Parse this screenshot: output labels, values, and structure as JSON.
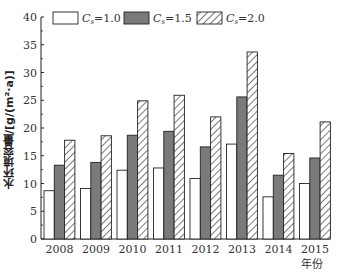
{
  "chart_data": {
    "type": "bar",
    "title": "",
    "xlabel": "年份",
    "ylabel": "水环境容量/[g/(m²·a)]",
    "ylim": [
      0,
      40
    ],
    "yticks": [
      0,
      5,
      10,
      15,
      20,
      25,
      30,
      35,
      40
    ],
    "grid": false,
    "legend_position": "top",
    "categories": [
      "2008",
      "2009",
      "2010",
      "2011",
      "2012",
      "2013",
      "2014",
      "2015"
    ],
    "series": [
      {
        "name": "Cs=1.0",
        "fill": "white",
        "values": [
          8.7,
          9.1,
          12.4,
          12.8,
          10.9,
          17.1,
          7.6,
          10.0
        ]
      },
      {
        "name": "Cs=1.5",
        "fill": "gray",
        "values": [
          13.3,
          13.8,
          18.7,
          19.4,
          16.6,
          25.6,
          11.5,
          14.6
        ]
      },
      {
        "name": "Cs=2.0",
        "fill": "hatched",
        "values": [
          17.8,
          18.6,
          24.9,
          25.9,
          22.0,
          33.7,
          15.4,
          21.1
        ]
      }
    ]
  },
  "legend": [
    {
      "label_main": "C",
      "label_sub": "s",
      "label_rest": "=1.0"
    },
    {
      "label_main": "C",
      "label_sub": "s",
      "label_rest": "=1.5"
    },
    {
      "label_main": "C",
      "label_sub": "s",
      "label_rest": "=2.0"
    }
  ],
  "colors": {
    "gray": "#7a7a7a",
    "stroke": "#222222"
  }
}
